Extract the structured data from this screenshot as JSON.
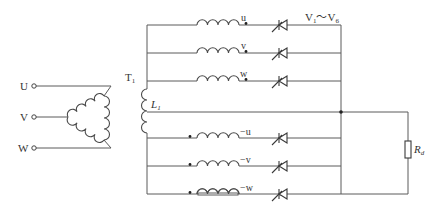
{
  "diagram": {
    "colors": {
      "line": "#5a5a5a",
      "text": "#333333",
      "background": "#ffffff"
    }
  },
  "supply_terminals": [
    {
      "label": "U"
    },
    {
      "label": "V"
    },
    {
      "label": "W"
    }
  ],
  "transformer": {
    "label": "T",
    "label_sub": "1"
  },
  "reactor": {
    "label": "L",
    "label_sub": "1"
  },
  "secondary_windings_positive": [
    {
      "label": "u"
    },
    {
      "label": "v"
    },
    {
      "label": "w"
    }
  ],
  "secondary_windings_negative": [
    {
      "label": "−u"
    },
    {
      "label": "−v"
    },
    {
      "label": "−w"
    }
  ],
  "thyristors": {
    "range_start": "V",
    "range_start_sub": "1",
    "range_sep": "～",
    "range_end": "V",
    "range_end_sub": "6"
  },
  "load": {
    "label": "R",
    "label_sub": "d"
  }
}
